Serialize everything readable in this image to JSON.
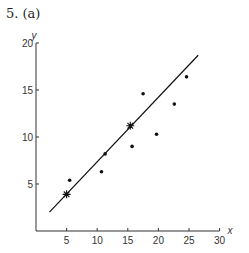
{
  "figure": {
    "caption": "5. (a)"
  },
  "chart_data": {
    "type": "scatter",
    "title": "5. (a)",
    "xlabel": "x",
    "ylabel": "y",
    "xlim": [
      0,
      30
    ],
    "ylim": [
      0,
      20
    ],
    "xticks": [
      5,
      10,
      15,
      20,
      25,
      30
    ],
    "yticks": [
      5,
      10,
      15,
      20
    ],
    "grid": false,
    "legend": null,
    "series": [
      {
        "name": "observations",
        "marker": "dot",
        "points": [
          {
            "x": 5.5,
            "y": 5.4
          },
          {
            "x": 10.7,
            "y": 6.3
          },
          {
            "x": 11.3,
            "y": 8.2
          },
          {
            "x": 15.7,
            "y": 9.0
          },
          {
            "x": 17.5,
            "y": 14.6
          },
          {
            "x": 19.7,
            "y": 10.3
          },
          {
            "x": 22.6,
            "y": 13.5
          },
          {
            "x": 24.6,
            "y": 16.4
          }
        ]
      },
      {
        "name": "fitted-line-anchor-points",
        "marker": "star",
        "points": [
          {
            "x": 5.0,
            "y": 3.9
          },
          {
            "x": 15.4,
            "y": 11.2
          }
        ]
      },
      {
        "name": "fitted-line",
        "type": "line",
        "points": [
          {
            "x": 2.2,
            "y": 2.0
          },
          {
            "x": 26.5,
            "y": 18.7
          }
        ]
      }
    ]
  }
}
